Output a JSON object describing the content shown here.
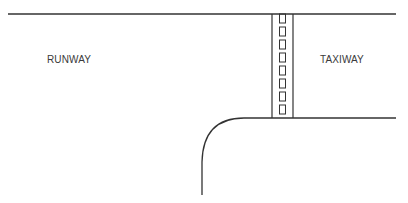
{
  "diagram": {
    "labels": {
      "runway": "RUNWAY",
      "taxiway": "TAXIWAY"
    },
    "colors": {
      "line": "#333333",
      "background": "#ffffff"
    },
    "elements": {
      "runway_edge_top": "runway edge line",
      "taxiway_edge_bottom": "taxiway edge line",
      "hold_short_marking": "holding position marking (dashed boxes between two solid lines)",
      "curved_fillet": "curved taxiway/runway edge",
      "hold_short_box_count": 9
    }
  }
}
